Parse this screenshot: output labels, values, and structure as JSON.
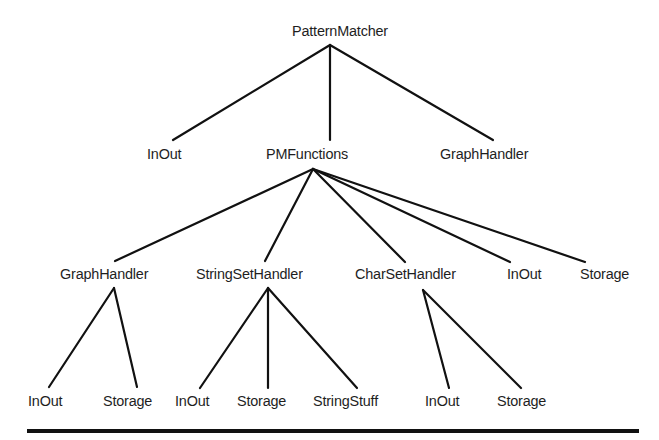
{
  "diagram": {
    "type": "tree",
    "root": "PatternMatcher",
    "nodes": {
      "root": {
        "label": "PatternMatcher",
        "x": 292,
        "y": 21
      },
      "l1_inout": {
        "label": "InOut",
        "x": 147,
        "y": 144
      },
      "l1_pmfunctions": {
        "label": "PMFunctions",
        "x": 266,
        "y": 144
      },
      "l1_graphhandler": {
        "label": "GraphHandler",
        "x": 440,
        "y": 144
      },
      "l2_graphhandler": {
        "label": "GraphHandler",
        "x": 60,
        "y": 264
      },
      "l2_stringsethandler": {
        "label": "StringSetHandler",
        "x": 196,
        "y": 264
      },
      "l2_charsethandler": {
        "label": "CharSetHandler",
        "x": 355,
        "y": 264
      },
      "l2_inout": {
        "label": "InOut",
        "x": 507,
        "y": 264
      },
      "l2_storage": {
        "label": "Storage",
        "x": 580,
        "y": 264
      },
      "l3_gh_inout": {
        "label": "InOut",
        "x": 28,
        "y": 391
      },
      "l3_gh_storage": {
        "label": "Storage",
        "x": 103,
        "y": 391
      },
      "l3_ssh_inout": {
        "label": "InOut",
        "x": 175,
        "y": 391
      },
      "l3_ssh_storage": {
        "label": "Storage",
        "x": 237,
        "y": 391
      },
      "l3_ssh_stringstuff": {
        "label": "StringStuff",
        "x": 313,
        "y": 391
      },
      "l3_csh_inout": {
        "label": "InOut",
        "x": 425,
        "y": 391
      },
      "l3_csh_storage": {
        "label": "Storage",
        "x": 497,
        "y": 391
      }
    },
    "edges": [
      {
        "from": "PatternMatcher",
        "to": "InOut",
        "x1": 330,
        "y1": 45,
        "x2": 173,
        "y2": 140
      },
      {
        "from": "PatternMatcher",
        "to": "PMFunctions",
        "x1": 330,
        "y1": 45,
        "x2": 330,
        "y2": 140
      },
      {
        "from": "PatternMatcher",
        "to": "GraphHandler",
        "x1": 330,
        "y1": 45,
        "x2": 493,
        "y2": 140
      },
      {
        "from": "PMFunctions",
        "to": "GraphHandler",
        "x1": 313,
        "y1": 169,
        "x2": 115,
        "y2": 261
      },
      {
        "from": "PMFunctions",
        "to": "StringSetHandler",
        "x1": 313,
        "y1": 169,
        "x2": 265,
        "y2": 261
      },
      {
        "from": "PMFunctions",
        "to": "CharSetHandler",
        "x1": 313,
        "y1": 169,
        "x2": 405,
        "y2": 262
      },
      {
        "from": "PMFunctions",
        "to": "InOut",
        "x1": 313,
        "y1": 169,
        "x2": 510,
        "y2": 262
      },
      {
        "from": "PMFunctions",
        "to": "Storage",
        "x1": 313,
        "y1": 169,
        "x2": 585,
        "y2": 262
      },
      {
        "from": "GraphHandler",
        "to": "InOut",
        "x1": 114,
        "y1": 288,
        "x2": 49,
        "y2": 387
      },
      {
        "from": "GraphHandler",
        "to": "Storage",
        "x1": 114,
        "y1": 288,
        "x2": 137,
        "y2": 387
      },
      {
        "from": "StringSetHandler",
        "to": "InOut",
        "x1": 268,
        "y1": 288,
        "x2": 200,
        "y2": 388
      },
      {
        "from": "StringSetHandler",
        "to": "Storage",
        "x1": 268,
        "y1": 288,
        "x2": 268,
        "y2": 388
      },
      {
        "from": "StringSetHandler",
        "to": "StringStuff",
        "x1": 268,
        "y1": 288,
        "x2": 357,
        "y2": 388
      },
      {
        "from": "CharSetHandler",
        "to": "InOut",
        "x1": 423,
        "y1": 290,
        "x2": 449,
        "y2": 388
      },
      {
        "from": "CharSetHandler",
        "to": "Storage",
        "x1": 423,
        "y1": 290,
        "x2": 521,
        "y2": 388
      }
    ],
    "colors": {
      "line": "#111111",
      "text": "#1e1e1e",
      "background": "#ffffff"
    }
  }
}
